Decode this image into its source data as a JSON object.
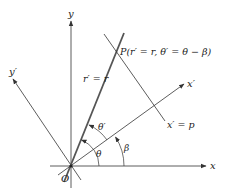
{
  "diagram": {
    "labels": {
      "y_axis": "y",
      "x_axis": "x",
      "x_prime_axis": "x′",
      "y_prime_axis": "y′",
      "origin": "O",
      "point_p": "P(r′ = r, θ′ = θ − β)",
      "ray_label": "r′ = r",
      "line_label": "x′ = p",
      "theta": "θ",
      "theta_prime": "θ′",
      "beta": "β"
    },
    "colors": {
      "line": "#333333",
      "thick_line": "#555555",
      "background": "#ffffff"
    }
  }
}
